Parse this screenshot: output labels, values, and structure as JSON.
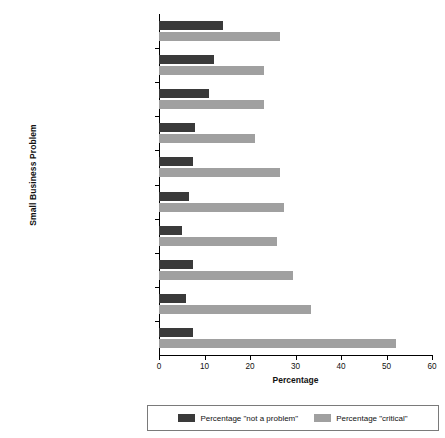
{
  "chart_data": {
    "type": "bar",
    "orientation": "horizontal",
    "title": "",
    "xlabel": "Percentage",
    "ylabel": "Small Business Problem",
    "xlim": [
      0,
      60
    ],
    "xticks": [
      0,
      10,
      20,
      30,
      40,
      50,
      60
    ],
    "grid": false,
    "legend_position": "bottom",
    "categories": [
      "Locating Qualified Employees",
      "State Taxes on Business Income",
      "Property Taxes",
      "Frequent Changes in Federal Tax Laws/Rules",
      "Uncertainty over Government Actions",
      "Tax Complexity",
      "Uncertainty over Economic Conditions",
      "Federal Taxes on Business Income",
      "Unreasonable Government Regulations",
      "Cost of Health Insurance"
    ],
    "category_lines": [
      [
        "Locating",
        "Qualified Employees"
      ],
      [
        "State Taxes on",
        "Business Income"
      ],
      [
        "Property Taxes"
      ],
      [
        "Frequent Changes in",
        "Federal Tax Laws/Rules"
      ],
      [
        "Uncertainty over",
        "Government Actions"
      ],
      [
        "Tax Complexity"
      ],
      [
        "Uncertainty over",
        "Economic Conditions"
      ],
      [
        "Federal Taxes on",
        "Business Income"
      ],
      [
        "Unreasonable",
        "Government Regulations"
      ],
      [
        "Cost of Health Insurance"
      ]
    ],
    "series": [
      {
        "name": "Percentage \"not a problem\"",
        "color": "#3a3a3a",
        "values": [
          14.0,
          12.0,
          11.0,
          8.0,
          7.5,
          6.5,
          5.0,
          7.5,
          6.0,
          7.5
        ]
      },
      {
        "name": "Percentage \"critical\"",
        "color": "#a0a0a0",
        "values": [
          26.5,
          23.0,
          23.0,
          21.0,
          26.5,
          27.5,
          26.0,
          29.5,
          33.5,
          52.0
        ]
      }
    ]
  },
  "legend": {
    "items": [
      {
        "label": "Percentage \"not a problem\"",
        "color": "#3a3a3a"
      },
      {
        "label": "Percentage \"critical\"",
        "color": "#a0a0a0"
      }
    ]
  }
}
